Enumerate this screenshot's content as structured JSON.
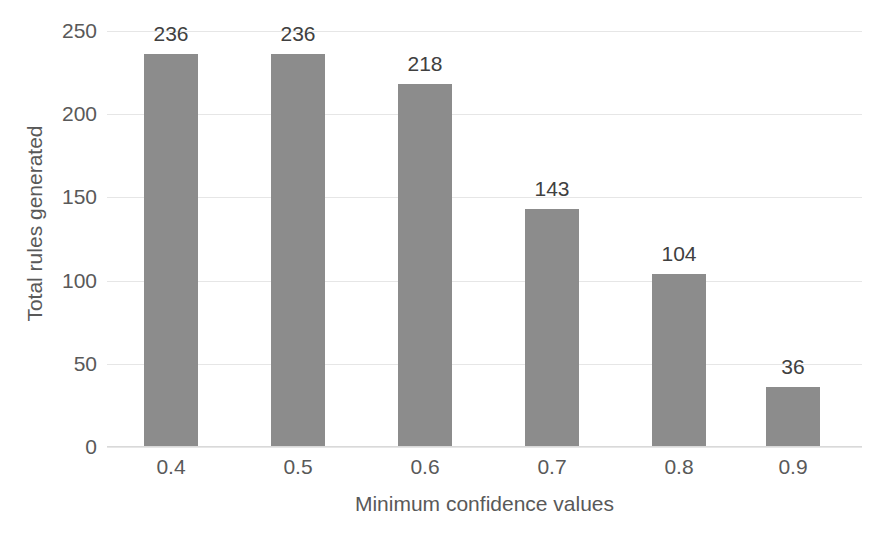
{
  "chart_data": {
    "type": "bar",
    "title": "",
    "xlabel": "Minimum confidence values",
    "ylabel": "Total rules generated",
    "categories": [
      "0.4",
      "0.5",
      "0.6",
      "0.7",
      "0.8",
      "0.9"
    ],
    "values": [
      236,
      236,
      218,
      143,
      104,
      36
    ],
    "data_labels": [
      "236",
      "236",
      "218",
      "143",
      "104",
      "36"
    ],
    "ylim": [
      0,
      250
    ],
    "y_ticks": [
      0,
      50,
      100,
      150,
      200,
      250
    ],
    "y_tick_labels": [
      "0",
      "50",
      "100",
      "150",
      "200",
      "250"
    ],
    "grid": "horizontal",
    "legend": "none",
    "series": [
      {
        "name": "Total rules generated",
        "values": [
          236,
          236,
          218,
          143,
          104,
          36
        ],
        "color": "#8c8c8c"
      }
    ],
    "colors": {
      "bar": "#8c8c8c",
      "gridline": "#e6e6e6",
      "axis_text": "#595959",
      "data_label_text": "#404040",
      "background": "#ffffff"
    }
  }
}
